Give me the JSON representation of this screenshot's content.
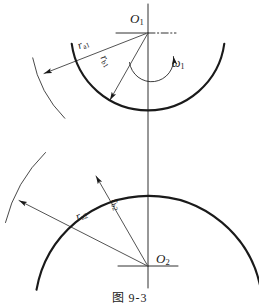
{
  "figure": {
    "caption": "图  9-3",
    "caption_plain": "Fig. 9-3",
    "background_color": "#ffffff",
    "line_color": "#1a1a1a"
  },
  "centers": {
    "upper": {
      "name": "O1",
      "label_main": "O",
      "label_sub": "1",
      "x": 148,
      "y": 33
    },
    "lower": {
      "name": "O2",
      "label_main": "O",
      "label_sub": "2",
      "x": 148,
      "y": 266
    }
  },
  "dimensions": [
    {
      "id": "ra1",
      "label_main": "r",
      "label_sub": "a1",
      "meaning": "addendum radius of gear 1",
      "from": "O1",
      "to_arc": "upper-outer-thin-arc",
      "angle_deg": -22
    },
    {
      "id": "rb1",
      "label_main": "r",
      "label_sub": "b1",
      "meaning": "base radius of gear 1",
      "from": "O1",
      "to_arc": "upper-thick-arc",
      "angle_deg": 60
    },
    {
      "id": "ra2",
      "label_main": "r",
      "label_sub": "a2",
      "meaning": "addendum radius of gear 2",
      "from": "O2",
      "to_arc": "lower-outer-thin-arc",
      "angle_deg": -23
    },
    {
      "id": "rb2",
      "label_main": "r",
      "label_sub": "b2",
      "meaning": "base radius of gear 2",
      "from": "O2",
      "to_arc": "lower-thick-arc",
      "angle_deg": 73
    }
  ],
  "angular_velocity": {
    "id": "omega1",
    "label_main": "ω",
    "label_sub": "1",
    "meaning": "angular velocity of gear 1",
    "direction": "counterclockwise-sweep-to-right"
  },
  "geometry": {
    "centerline_x": 148,
    "upper_thick_arc": {
      "center_x": 148,
      "center_y": 33,
      "radius": 77,
      "start_deg": 172,
      "end_deg": 352,
      "stroke_width": 2.1
    },
    "upper_thin_arc": {
      "center_x": 148,
      "center_y": 33,
      "radius": 117,
      "start_deg": 152,
      "end_deg": 206,
      "stroke_width": 0.8
    },
    "lower_thick_arc": {
      "center_x": 148,
      "center_y": 266,
      "radius": 114,
      "start_deg": 168,
      "end_deg": 352,
      "stroke_width": 2.1
    },
    "lower_thin_arc": {
      "center_x": 148,
      "center_y": 266,
      "radius": 148,
      "start_deg": 180,
      "end_deg": 230,
      "stroke_width": 0.8
    }
  }
}
